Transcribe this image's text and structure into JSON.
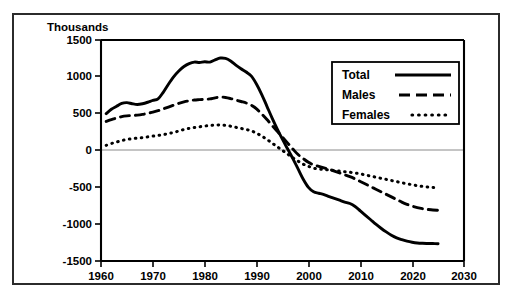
{
  "chart_data": {
    "type": "line",
    "title": "",
    "subtitle": "",
    "xlabel": "",
    "ylabel": "Thousands",
    "ylabel_position": "top-left",
    "xlim": [
      1960,
      2030
    ],
    "ylim": [
      -1500,
      1500
    ],
    "xticks": [
      1960,
      1970,
      1980,
      1990,
      2000,
      2010,
      2020,
      2030
    ],
    "yticks": [
      1500,
      1000,
      500,
      0,
      -500,
      -1000,
      -1500
    ],
    "xtick_labels": [
      "1960",
      "1970",
      "1980",
      "1990",
      "2000",
      "2010",
      "2020",
      "2030"
    ],
    "ytick_labels": [
      "1500",
      "1000",
      "500",
      "0",
      "-500",
      "-1000",
      "-1500"
    ],
    "grid": false,
    "zero_line": true,
    "legend_position": "upper-right",
    "legend_entries": [
      "Total",
      "Males",
      "Females"
    ],
    "x": [
      1961,
      1962,
      1963,
      1964,
      1965,
      1966,
      1967,
      1968,
      1969,
      1970,
      1971,
      1972,
      1973,
      1974,
      1975,
      1976,
      1977,
      1978,
      1979,
      1980,
      1981,
      1982,
      1983,
      1984,
      1985,
      1986,
      1987,
      1988,
      1989,
      1990,
      1991,
      1992,
      1993,
      1994,
      1995,
      1996,
      1997,
      1998,
      1999,
      2000,
      2001,
      2002,
      2003,
      2004,
      2005,
      2006,
      2007,
      2008,
      2009,
      2010,
      2011,
      2012,
      2013,
      2014,
      2015,
      2016,
      2017,
      2018,
      2019,
      2020,
      2021,
      2022,
      2023,
      2024,
      2025
    ],
    "series": [
      {
        "name": "Total",
        "style": "solid",
        "color": "#000000",
        "values": [
          500,
          560,
          600,
          640,
          650,
          635,
          625,
          635,
          655,
          680,
          700,
          790,
          900,
          1000,
          1080,
          1140,
          1180,
          1200,
          1195,
          1205,
          1200,
          1230,
          1255,
          1250,
          1215,
          1160,
          1110,
          1065,
          1010,
          900,
          760,
          600,
          440,
          290,
          150,
          20,
          -110,
          -250,
          -390,
          -500,
          -560,
          -580,
          -600,
          -625,
          -650,
          -675,
          -700,
          -720,
          -760,
          -820,
          -880,
          -940,
          -1000,
          -1055,
          -1105,
          -1150,
          -1185,
          -1210,
          -1230,
          -1245,
          -1255,
          -1260,
          -1262,
          -1263,
          -1265
        ]
      },
      {
        "name": "Males",
        "style": "dashed",
        "color": "#000000",
        "values": [
          395,
          420,
          440,
          460,
          470,
          475,
          480,
          490,
          505,
          520,
          540,
          565,
          590,
          615,
          640,
          660,
          675,
          685,
          690,
          695,
          700,
          715,
          725,
          720,
          705,
          685,
          665,
          645,
          615,
          565,
          495,
          420,
          340,
          260,
          180,
          100,
          20,
          -55,
          -110,
          -160,
          -195,
          -215,
          -235,
          -255,
          -280,
          -305,
          -330,
          -355,
          -385,
          -420,
          -455,
          -490,
          -525,
          -560,
          -595,
          -630,
          -665,
          -700,
          -730,
          -755,
          -775,
          -790,
          -800,
          -808,
          -812
        ]
      },
      {
        "name": "Females",
        "style": "dotted",
        "color": "#000000",
        "values": [
          70,
          95,
          115,
          135,
          150,
          160,
          168,
          175,
          185,
          195,
          205,
          215,
          230,
          245,
          265,
          285,
          300,
          312,
          322,
          332,
          340,
          345,
          348,
          342,
          330,
          315,
          300,
          285,
          265,
          235,
          195,
          150,
          100,
          50,
          0,
          -50,
          -100,
          -145,
          -185,
          -215,
          -240,
          -250,
          -258,
          -265,
          -272,
          -280,
          -288,
          -295,
          -305,
          -318,
          -332,
          -348,
          -362,
          -378,
          -392,
          -408,
          -422,
          -438,
          -452,
          -465,
          -478,
          -488,
          -496,
          -502,
          -508
        ]
      }
    ]
  }
}
